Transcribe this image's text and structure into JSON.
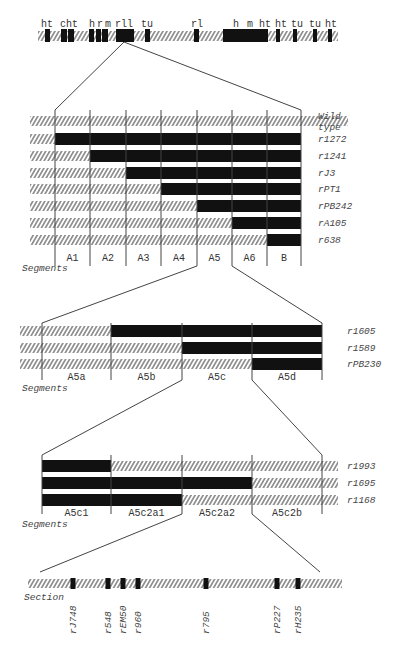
{
  "colors": {
    "ink": "#111111",
    "hatch": "#555555",
    "line": "#444444",
    "background": "#ffffff"
  },
  "chromosome": {
    "labels": [
      {
        "text": "ht",
        "x": 47
      },
      {
        "text": "c",
        "x": 63
      },
      {
        "text": "ht",
        "x": 72
      },
      {
        "text": "h",
        "x": 92
      },
      {
        "text": "r",
        "x": 100
      },
      {
        "text": "m",
        "x": 108
      },
      {
        "text": "rll",
        "x": 124
      },
      {
        "text": "tu",
        "x": 147
      },
      {
        "text": "rl",
        "x": 197
      },
      {
        "text": "h",
        "x": 236
      },
      {
        "text": "m",
        "x": 250
      },
      {
        "text": "ht",
        "x": 265
      },
      {
        "text": "ht",
        "x": 281
      },
      {
        "text": "tu",
        "x": 297
      },
      {
        "text": "tu",
        "x": 315
      },
      {
        "text": "ht",
        "x": 331
      }
    ],
    "bands": [
      {
        "x": 45,
        "w": 5
      },
      {
        "x": 61,
        "w": 6
      },
      {
        "x": 68,
        "w": 6
      },
      {
        "x": 89,
        "w": 5
      },
      {
        "x": 96,
        "w": 5
      },
      {
        "x": 102,
        "w": 6
      },
      {
        "x": 116,
        "w": 18
      },
      {
        "x": 145,
        "w": 5
      },
      {
        "x": 194,
        "w": 5
      },
      {
        "x": 223,
        "w": 22
      },
      {
        "x": 245,
        "w": 13
      },
      {
        "x": 258,
        "w": 10
      },
      {
        "x": 276,
        "w": 4
      },
      {
        "x": 293,
        "w": 4
      },
      {
        "x": 313,
        "w": 4
      },
      {
        "x": 328,
        "w": 4
      }
    ]
  },
  "panel1": {
    "boundaries": [
      55,
      90,
      126,
      161,
      197,
      232,
      267,
      301
    ],
    "segments": [
      "A1",
      "A2",
      "A3",
      "A4",
      "A5",
      "A6",
      "B"
    ],
    "segments_label": "Segments",
    "rows": [
      {
        "name": "Wild",
        "name2": "type",
        "deletion_start": null
      },
      {
        "name": "r1272",
        "deletion_start": 0
      },
      {
        "name": "r1241",
        "deletion_start": 1
      },
      {
        "name": "rJ3",
        "deletion_start": 2
      },
      {
        "name": "rPT1",
        "deletion_start": 3
      },
      {
        "name": "rPB242",
        "deletion_start": 4
      },
      {
        "name": "rA105",
        "deletion_start": 5
      },
      {
        "name": "r638",
        "deletion_start": 6
      }
    ]
  },
  "panel2": {
    "boundaries": [
      42,
      111,
      182,
      252,
      322
    ],
    "segments": [
      "A5a",
      "A5b",
      "A5c",
      "A5d"
    ],
    "segments_label": "Segments",
    "rows": [
      {
        "name": "r1605",
        "deletion_start": 1
      },
      {
        "name": "r1589",
        "deletion_start": 2
      },
      {
        "name": "rPB230",
        "deletion_start": 3
      }
    ]
  },
  "panel3": {
    "boundaries": [
      42,
      111,
      182,
      252,
      322
    ],
    "segments": [
      "A5c1",
      "A5c2a1",
      "A5c2a2",
      "A5c2b"
    ],
    "segments_label": "Segments",
    "rows": [
      {
        "name": "r1993",
        "deletion_end": 1
      },
      {
        "name": "r1695",
        "deletion_end": 3
      },
      {
        "name": "r1168",
        "deletion_end": 2
      }
    ]
  },
  "panel4": {
    "label": "Section",
    "markers": [
      {
        "name": "rJ748",
        "x": 73
      },
      {
        "name": "r548",
        "x": 108
      },
      {
        "name": "rEM50",
        "x": 123
      },
      {
        "name": "r960",
        "x": 138
      },
      {
        "name": "r795",
        "x": 206
      },
      {
        "name": "rP227",
        "x": 277
      },
      {
        "name": "rH235",
        "x": 298
      }
    ]
  }
}
